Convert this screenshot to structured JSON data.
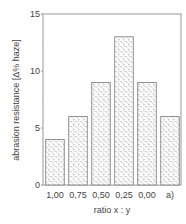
{
  "chart_data": {
    "type": "bar",
    "title": "",
    "xlabel": "ratio x : y",
    "ylabel": "abrasion resistance [Δ% haze]",
    "categories": [
      "1,00",
      "0,75",
      "0,50",
      "0,25",
      "0,00",
      "a)"
    ],
    "values": [
      4,
      6,
      9,
      13,
      9,
      6
    ],
    "ylim": [
      0,
      15
    ],
    "yticks": [
      0,
      5,
      10,
      15
    ],
    "ytick_labels": [
      "0",
      "5",
      "10",
      "15"
    ],
    "grid": false,
    "legend": null,
    "bar_fill": "hatched (dashed diagonal pattern)",
    "colors": {
      "axis": "#888888",
      "bar_edge": "#777777",
      "hatch": "#666666",
      "text": "#444444"
    }
  }
}
